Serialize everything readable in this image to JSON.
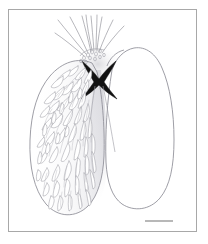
{
  "figure": {
    "kind": "scientific-line-drawing",
    "caption": "",
    "background_color": "#ffffff",
    "frame": {
      "visible": true,
      "color": "#a8a8a8",
      "line_width": 1,
      "x": 8,
      "y": 9,
      "width": 189,
      "height": 223
    },
    "scale_bar": {
      "visible": true,
      "label": "",
      "color": "#9a9a9a",
      "line_width": 1.4,
      "x1": 145,
      "x2": 173,
      "y": 221
    },
    "ink": {
      "outline": "#8d8d96",
      "seta_stroke": "#9b9ba3",
      "dark_structure": "#121212",
      "bristle": "#8f8f98",
      "shading": "#d8d8dc"
    },
    "parts": [
      {
        "name": "left-lobe",
        "description": "large ovoid lobe densely covered with curved setae",
        "textured": true
      },
      {
        "name": "right-lobe",
        "description": "smooth ovoid lobe, outline only",
        "textured": false
      },
      {
        "name": "central-sclerite",
        "description": "dark bowtie / X-shaped sclerotized plate at the junction",
        "textured": false
      },
      {
        "name": "apical-bristles",
        "description": "long radiating bristles fanning from the apex",
        "textured": false
      },
      {
        "name": "apical-cluster",
        "description": "granulate cluster at the base of the bristles",
        "textured": false
      },
      {
        "name": "median-shading",
        "description": "soft gray wash between the two lobes",
        "textured": false
      }
    ]
  }
}
